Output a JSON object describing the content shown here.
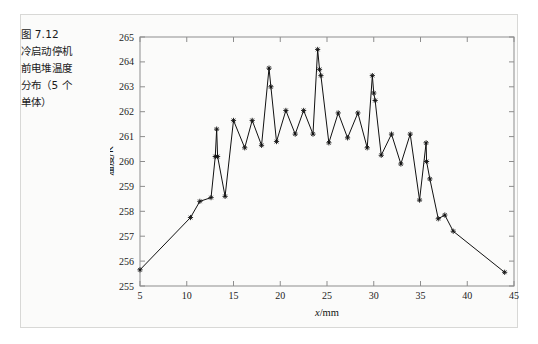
{
  "figure": {
    "caption_lines": [
      "图 7.12",
      "冷启动停机",
      "前电堆温度",
      "分布（5 个",
      "单体）"
    ],
    "frame_color": "#d8d8d6",
    "background_color": "#fbfbfa"
  },
  "chart_data": {
    "type": "line",
    "title": "",
    "xlabel": "x/mm",
    "ylabel": "温度/K",
    "xlim": [
      5,
      45
    ],
    "ylim": [
      255,
      265
    ],
    "xticks": [
      5,
      10,
      15,
      20,
      25,
      30,
      35,
      40,
      45
    ],
    "xtick_labels": [
      "5",
      "10",
      "15",
      "20",
      "25",
      "30",
      "35",
      "40",
      "45"
    ],
    "yticks": [
      255,
      256,
      257,
      258,
      259,
      260,
      261,
      262,
      263,
      264,
      265
    ],
    "ytick_labels": [
      "255",
      "256",
      "257",
      "258",
      "259",
      "260",
      "261",
      "262",
      "263",
      "264",
      "265"
    ],
    "grid": false,
    "legend": null,
    "line_color": "#111111",
    "marker": "star",
    "series": [
      {
        "name": "电堆温度分布",
        "points": [
          [
            5.0,
            255.65
          ],
          [
            10.4,
            257.75
          ],
          [
            11.4,
            258.4
          ],
          [
            12.6,
            258.55
          ],
          [
            13.05,
            260.2
          ],
          [
            13.2,
            261.3
          ],
          [
            13.3,
            260.2
          ],
          [
            14.1,
            258.6
          ],
          [
            15.0,
            261.65
          ],
          [
            16.2,
            260.55
          ],
          [
            17.0,
            261.65
          ],
          [
            18.0,
            260.65
          ],
          [
            18.8,
            263.75
          ],
          [
            19.0,
            263.0
          ],
          [
            19.6,
            260.8
          ],
          [
            20.6,
            262.05
          ],
          [
            21.6,
            261.1
          ],
          [
            22.5,
            262.05
          ],
          [
            23.5,
            261.1
          ],
          [
            24.0,
            264.5
          ],
          [
            24.2,
            263.7
          ],
          [
            24.35,
            263.45
          ],
          [
            25.2,
            260.75
          ],
          [
            26.2,
            261.95
          ],
          [
            27.2,
            260.95
          ],
          [
            28.3,
            261.95
          ],
          [
            29.3,
            260.55
          ],
          [
            29.85,
            263.45
          ],
          [
            30.0,
            262.75
          ],
          [
            30.15,
            262.45
          ],
          [
            30.8,
            260.25
          ],
          [
            31.9,
            261.1
          ],
          [
            32.9,
            259.9
          ],
          [
            33.9,
            261.1
          ],
          [
            34.9,
            258.45
          ],
          [
            35.6,
            260.75
          ],
          [
            35.65,
            260.0
          ],
          [
            36.0,
            259.3
          ],
          [
            36.9,
            257.7
          ],
          [
            37.6,
            257.85
          ],
          [
            38.5,
            257.2
          ],
          [
            44.0,
            255.55
          ]
        ]
      }
    ]
  }
}
